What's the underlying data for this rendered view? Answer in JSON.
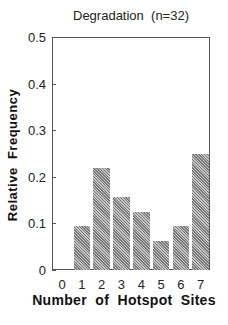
{
  "chart_data": {
    "type": "bar",
    "title": "Degradation  (n=32)",
    "xlabel": "Number  of  Hotspot  Sites",
    "ylabel": "Relative  Frequency",
    "categories": [
      "0",
      "1",
      "2",
      "3",
      "4",
      "5",
      "6",
      "7"
    ],
    "values": [
      0,
      0.094,
      0.219,
      0.156,
      0.125,
      0.063,
      0.094,
      0.25
    ],
    "ylim": [
      0,
      0.5
    ],
    "yticks": [
      "0",
      "0.1",
      "0.2",
      "0.3",
      "0.4",
      "0.5"
    ],
    "grid": false,
    "legend": null,
    "bar_fill": "hatched gray"
  }
}
